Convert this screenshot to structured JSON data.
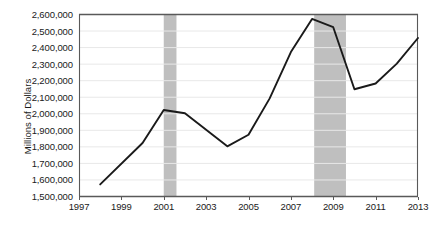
{
  "chart_data": {
    "type": "line",
    "title": "",
    "xlabel": "",
    "ylabel": "Millions of Dollars",
    "xlim": [
      1997,
      2013
    ],
    "ylim": [
      1500000,
      2600000
    ],
    "grid": true,
    "legend": "none",
    "x": [
      1998,
      2000,
      2001,
      2002,
      2004,
      2005,
      2006,
      2007,
      2008,
      2009,
      2010,
      2011,
      2012,
      2013
    ],
    "values": [
      1570000,
      1820000,
      2020000,
      2000000,
      1800000,
      1870000,
      2090000,
      2370000,
      2570000,
      2520000,
      2145000,
      2180000,
      2300000,
      2455000
    ],
    "series": [
      {
        "name": "Millions of Dollars",
        "values": [
          1570000,
          1820000,
          2020000,
          2000000,
          1800000,
          1870000,
          2090000,
          2370000,
          2570000,
          2520000,
          2145000,
          2180000,
          2300000,
          2455000
        ]
      }
    ],
    "ytick_labels": [
      "2,600,000",
      "2,500,000",
      "2,400,000",
      "2,300,000",
      "2,200,000",
      "2,100,000",
      "2,000,000",
      "1,900,000",
      "1,800,000",
      "1,700,000",
      "1,600,000",
      "1,500,000"
    ],
    "ytick_values": [
      2600000,
      2500000,
      2400000,
      2300000,
      2200000,
      2100000,
      2000000,
      1900000,
      1800000,
      1700000,
      1600000,
      1500000
    ],
    "xtick_labels": [
      "1997",
      "1999",
      "2001",
      "2003",
      "2005",
      "2007",
      "2009",
      "2011",
      "2013"
    ],
    "xtick_values": [
      1997,
      1999,
      2001,
      2003,
      2005,
      2007,
      2009,
      2011,
      2013
    ],
    "shaded_bands": [
      {
        "start": 2001.0,
        "end": 2001.6
      },
      {
        "start": 2008.1,
        "end": 2009.6
      }
    ],
    "colors": {
      "line": "#1a1a1a",
      "band": "#bfbfbf",
      "grid": "#e8e8e8",
      "axis": "#595959",
      "background": "#ffffff",
      "text": "#1a1a1a"
    }
  }
}
